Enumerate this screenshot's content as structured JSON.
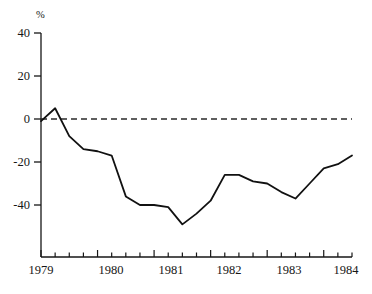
{
  "chart_data": {
    "type": "line",
    "title": "",
    "subtitle": "",
    "xlabel": "",
    "ylabel": "%",
    "ylim": [
      -55,
      40
    ],
    "xlim": [
      1979.0,
      1984.5
    ],
    "grid": false,
    "legend": null,
    "zero_reference_line": 0,
    "y_ticks": [
      40,
      20,
      0,
      -20,
      -40
    ],
    "y_tick_labels": [
      "40",
      "20",
      "0",
      "-20",
      "-40"
    ],
    "x_ticks": [
      1979,
      1979.25,
      1979.5,
      1979.75,
      1980,
      1980.25,
      1980.5,
      1980.75,
      1981,
      1981.25,
      1981.5,
      1981.75,
      1982,
      1982.25,
      1982.5,
      1982.75,
      1983,
      1983.25,
      1983.5,
      1983.75,
      1984,
      1984.25,
      1984.5
    ],
    "x_tick_labels": [
      "1979",
      "1980",
      "1981",
      "1982",
      "1983",
      "1984"
    ],
    "x_major_ticks": [
      1979,
      1980,
      1981,
      1982,
      1983,
      1984
    ],
    "series": [
      {
        "name": "",
        "color": "#111111",
        "x": [
          1979.0,
          1979.25,
          1979.5,
          1979.75,
          1980.0,
          1980.25,
          1980.5,
          1980.75,
          1981.0,
          1981.25,
          1981.5,
          1981.75,
          1982.0,
          1982.25,
          1982.5,
          1982.75,
          1983.0,
          1983.25,
          1983.5,
          1983.75,
          1984.0,
          1984.25,
          1984.5
        ],
        "values": [
          -1,
          5,
          -8,
          -14,
          -15,
          -17,
          -36,
          -40,
          -40,
          -41,
          -49,
          -44,
          -38,
          -26,
          -26,
          -29,
          -30,
          -34,
          -37,
          -30,
          -23,
          -21,
          -17
        ]
      }
    ],
    "annotations": []
  },
  "axis": {
    "unit_label": "%"
  }
}
